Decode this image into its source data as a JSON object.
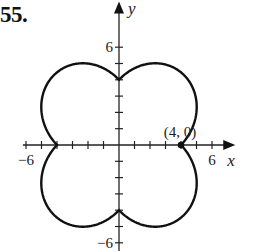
{
  "problem_number": "55.",
  "chart_data": {
    "type": "line",
    "kind": "polar-curve",
    "title": "",
    "equation_hint": "r = 4 + 2|sin 2θ|",
    "xlabel": "x",
    "ylabel": "y",
    "xlim": [
      -6.2,
      7.5
    ],
    "ylim": [
      -6.5,
      8.8
    ],
    "x_ticks": [
      -6,
      -5,
      -4,
      -3,
      -2,
      -1,
      1,
      2,
      3,
      4,
      5,
      6
    ],
    "y_ticks": [
      -6,
      -5,
      -4,
      -3,
      -2,
      -1,
      1,
      2,
      3,
      4,
      5,
      6
    ],
    "x_tick_labels": [
      {
        "value": -6,
        "text": "−6"
      },
      {
        "value": 6,
        "text": "6"
      }
    ],
    "y_tick_labels": [
      {
        "value": 6,
        "text": "6"
      },
      {
        "value": -6,
        "text": "−6"
      }
    ],
    "grid": false,
    "legend": null,
    "annotations": [
      {
        "text": "(4, 0)",
        "x": 4,
        "y": 0,
        "marker": "filled-dot"
      }
    ],
    "key_points": [
      {
        "x": 4,
        "y": 0
      },
      {
        "x": 0,
        "y": 4
      },
      {
        "x": -4,
        "y": 0
      },
      {
        "x": 0,
        "y": -4
      }
    ],
    "extent_points": [
      {
        "x": 5.0,
        "y": 2.4
      },
      {
        "x": 2.0,
        "y": 5.0
      },
      {
        "x": -2.0,
        "y": 5.0
      },
      {
        "x": -5.0,
        "y": 2.4
      },
      {
        "x": -5.0,
        "y": -2.4
      },
      {
        "x": -2.0,
        "y": -5.0
      },
      {
        "x": 2.0,
        "y": -5.0
      },
      {
        "x": 5.0,
        "y": -2.4
      }
    ],
    "polar": {
      "a": 4,
      "b": 2,
      "k": 2,
      "abs": true
    }
  },
  "axes_px": {
    "origin_x": 119,
    "origin_y": 145,
    "unit_x": 15.5,
    "unit_y": 16.3
  }
}
